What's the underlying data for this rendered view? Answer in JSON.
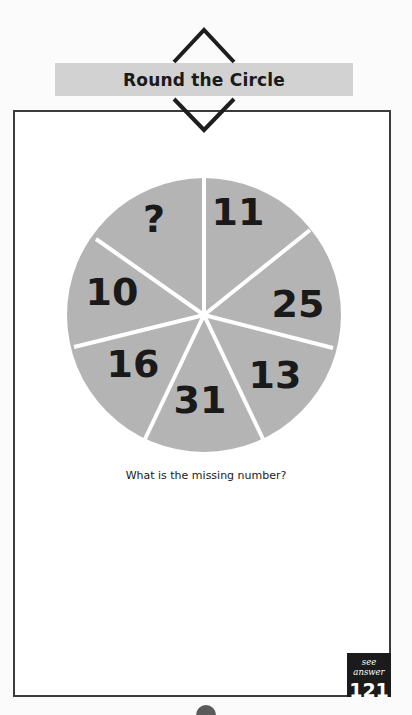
{
  "header": {
    "title": "Round the Circle"
  },
  "puzzle": {
    "question": "What is the missing number?",
    "segments": [
      {
        "label": "11",
        "position": "top-right"
      },
      {
        "label": "25",
        "position": "right"
      },
      {
        "label": "13",
        "position": "bottom-right"
      },
      {
        "label": "31",
        "position": "bottom"
      },
      {
        "label": "16",
        "position": "bottom-left"
      },
      {
        "label": "10",
        "position": "left"
      },
      {
        "label": "?",
        "position": "top-left"
      }
    ],
    "colors": {
      "wheel_fill": "#b4b4b4",
      "divider": "#ffffff",
      "numbers": "#1a1a1a"
    }
  },
  "answer_ref": {
    "label": "see answer",
    "page": "121"
  }
}
